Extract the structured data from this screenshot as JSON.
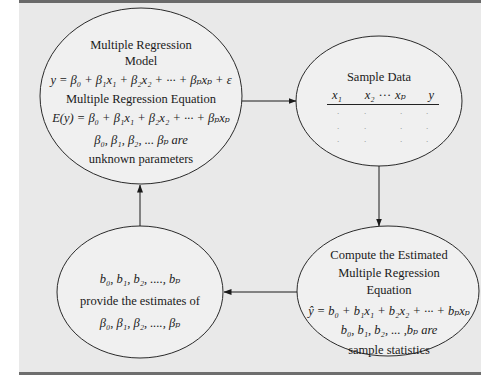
{
  "diagram": {
    "type": "flowchart",
    "nodes": {
      "population_model": {
        "lines": [
          "Multiple Regression",
          "Model",
          "y = β₀ + β₁x₁ + β₂x₂ + ··· + βₚxₚ + ε",
          "Multiple Regression Equation",
          "E(y) = β₀ + β₁x₁ + β₂x₂ + ··· + βₚxₚ",
          "β₀, β₁, β₂, ... βₚ are",
          "unknown parameters"
        ]
      },
      "sample_data": {
        "title": "Sample Data",
        "columns": [
          "x₁",
          "x₂",
          "···",
          "xₚ",
          "y"
        ],
        "rows": [
          [
            ".",
            ".",
            ".",
            "."
          ],
          [
            ".",
            ".",
            ".",
            "."
          ],
          [
            ".",
            ".",
            ".",
            "."
          ]
        ]
      },
      "compute_equation": {
        "lines": [
          "Compute the Estimated",
          "Multiple Regression",
          "Equation",
          "ŷ = b₀ + b₁x₁ + b₂x₂ + ··· + bₚxₚ",
          "b₀, b₁, b₂, ... ,bₚ are",
          "sample statistics"
        ]
      },
      "estimates": {
        "lines": [
          "b₀, b₁, b₂, ...., bₚ",
          "provide the estimates of",
          "β₀, β₁, β₂, ...., βₚ"
        ]
      }
    },
    "edges": [
      {
        "from": "population_model",
        "to": "sample_data",
        "direction": "right"
      },
      {
        "from": "sample_data",
        "to": "compute_equation",
        "direction": "down"
      },
      {
        "from": "compute_equation",
        "to": "estimates",
        "direction": "left"
      },
      {
        "from": "estimates",
        "to": "population_model",
        "direction": "up"
      }
    ]
  },
  "colors": {
    "panel_background": "#e9e9e9",
    "ellipse_fill": "#f0f0f0",
    "stroke": "#2a2a2a",
    "bars": "#6a6a6a"
  }
}
